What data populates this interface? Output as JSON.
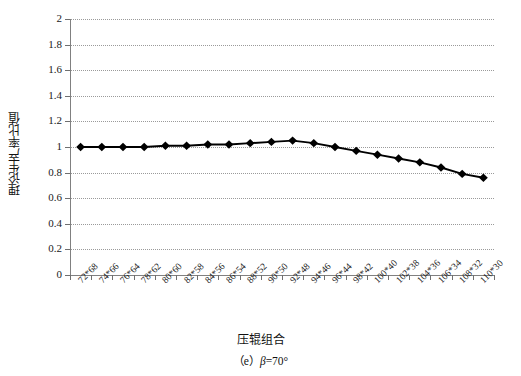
{
  "figure": {
    "caption_prefix": "（e）",
    "caption_symbol": "β",
    "caption_value": "=70°",
    "caption_full": "（e） β=70°"
  },
  "axes": {
    "x_title": "压辊组合",
    "y_title": "理论生产率比值",
    "y_ticks": [
      "0",
      "0.2",
      "0.4",
      "0.6",
      "0.8",
      "1",
      "1.2",
      "1.4",
      "1.6",
      "1.8",
      "2"
    ],
    "y_min": 0,
    "y_max": 2,
    "y_step": 0.2
  },
  "chart_data": {
    "type": "line",
    "title": "",
    "xlabel": "压辊组合",
    "ylabel": "理论生产率比值",
    "ylim": [
      0,
      2
    ],
    "grid": true,
    "legend": "none",
    "marker": "diamond",
    "line_color": "#000000",
    "marker_color": "#000000",
    "categories": [
      "72*68",
      "74*66",
      "76*64",
      "78*62",
      "80*60",
      "82*58",
      "84*56",
      "86*54",
      "88*52",
      "90*50",
      "92*48",
      "94*46",
      "96*44",
      "98*42",
      "100*40",
      "102*38",
      "104*36",
      "106*34",
      "108*32",
      "110*30"
    ],
    "values": [
      1.0,
      1.0,
      1.0,
      1.0,
      1.01,
      1.01,
      1.02,
      1.02,
      1.03,
      1.04,
      1.05,
      1.03,
      1.0,
      0.97,
      0.94,
      0.91,
      0.88,
      0.84,
      0.79,
      0.76
    ],
    "series": [
      {
        "name": "理论生产率比值",
        "values": [
          1.0,
          1.0,
          1.0,
          1.0,
          1.01,
          1.01,
          1.02,
          1.02,
          1.03,
          1.04,
          1.05,
          1.03,
          1.0,
          0.97,
          0.94,
          0.91,
          0.88,
          0.84,
          0.79,
          0.76
        ]
      }
    ]
  }
}
